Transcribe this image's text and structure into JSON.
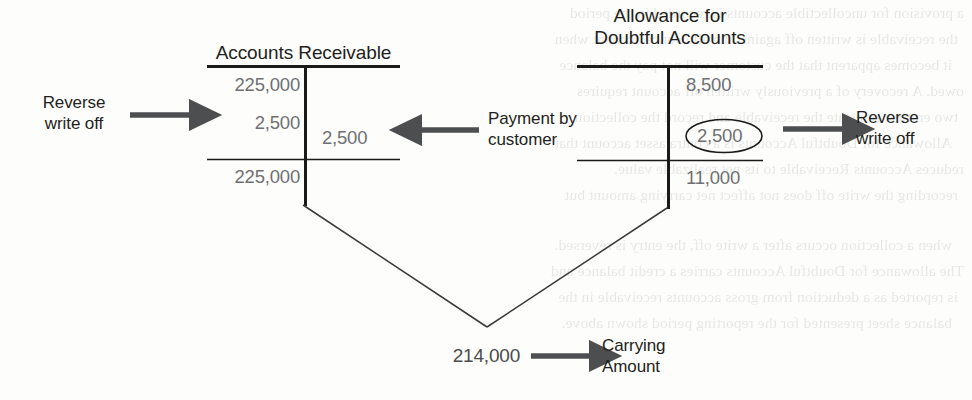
{
  "diagram": {
    "accounts": [
      {
        "id": "accounts-receivable",
        "name": "Accounts Receivable",
        "title_lines": [
          "Accounts Receivable"
        ],
        "debits": [
          "225,000",
          "2,500"
        ],
        "credits": [
          "2,500"
        ],
        "balance": "225,000",
        "balance_side": "debit"
      },
      {
        "id": "allowance-for-doubtful-accounts",
        "name": "Allowance for Doubtful Accounts",
        "title_lines": [
          "Allowance for",
          "Doubtful Accounts"
        ],
        "debits": [],
        "credits": [
          "8,500",
          "2,500"
        ],
        "balance": "11,000",
        "balance_side": "credit",
        "highlighted_credit": "2,500"
      }
    ],
    "annotations": [
      {
        "id": "reverse-write-off-left",
        "lines": [
          "Reverse",
          "write off"
        ],
        "arrow": "right"
      },
      {
        "id": "payment-by-customer",
        "lines": [
          "Payment by",
          "customer"
        ],
        "arrow": "left"
      },
      {
        "id": "reverse-write-off-right",
        "lines": [
          "Reverse",
          "write off"
        ],
        "arrow": "right"
      }
    ],
    "result": {
      "value": "214,000",
      "label_lines": [
        "Carrying",
        "Amount"
      ],
      "arrow": "right"
    },
    "colors": {
      "ink": "#231f20",
      "amount": "#6f7072",
      "rule": "#1a1a1a",
      "arrow": "#4d4e50",
      "connector": "#3a3a3a",
      "paper": "#fdfdfc"
    }
  },
  "ghost_text": {
    "lines": [
      "a provision for uncollectible accounts is recorded in the period",
      "the receivable is written off against the allowance account when",
      "it becomes apparent that the customer will not pay the balance",
      "owed. A recovery of a previously written off account requires",
      "two entries: reinstate the receivable and record the collection.",
      "Allowance for Doubtful Accounts is a contra asset account that",
      "reduces Accounts Receivable to its net realizable value.",
      "recording the write off does not affect net carrying amount but",
      "when a collection occurs after a write off, the entry is reversed.",
      "The allowance for Doubtful Accounts carries a credit balance and",
      "is reported as a deduction from gross accounts receivable in the",
      "balance sheet presented for the reporting period shown above."
    ]
  }
}
